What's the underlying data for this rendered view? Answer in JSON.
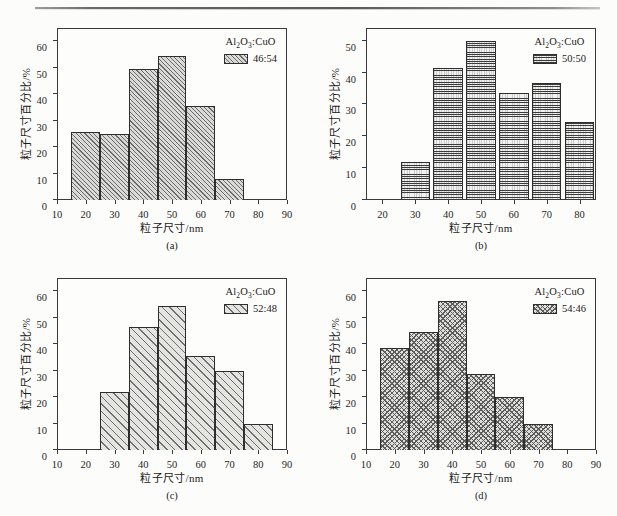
{
  "figure": {
    "axis_title_x": "粒子尺寸/nm",
    "axis_title_y": "粒子尺寸百分比/%",
    "legend_header_html": "Al2O3:CuO",
    "legend_header_parts": {
      "al": "Al",
      "two": "2",
      "o": "O",
      "three": "3",
      "colon_cuo": ":CuO"
    }
  },
  "panels": [
    {
      "id": "a",
      "caption": "(a)",
      "legend_ratio": "46:54",
      "pattern": "diagonal-hatch-dense",
      "xlim": [
        10,
        90
      ],
      "ylim": [
        0,
        65
      ],
      "xticks": [
        10,
        20,
        30,
        40,
        50,
        60,
        70,
        80,
        90
      ],
      "yticks": [
        0,
        10,
        20,
        30,
        40,
        50,
        60
      ],
      "bar_width_nm": 10,
      "bars": [
        {
          "center": 20,
          "value": 25.8
        },
        {
          "center": 30,
          "value": 24.8
        },
        {
          "center": 40,
          "value": 49.4
        },
        {
          "center": 50,
          "value": 54.3
        },
        {
          "center": 60,
          "value": 35.4
        },
        {
          "center": 70,
          "value": 7.8
        }
      ]
    },
    {
      "id": "b",
      "caption": "(b)",
      "legend_ratio": "50:50",
      "pattern": "grid-crosshatch",
      "xlim": [
        15,
        85
      ],
      "ylim": [
        0,
        54
      ],
      "xticks": [
        20,
        30,
        40,
        50,
        60,
        70,
        80
      ],
      "yticks": [
        0,
        10,
        20,
        30,
        40,
        50
      ],
      "bar_width_nm": 9,
      "bars": [
        {
          "center": 30,
          "value": 11.9
        },
        {
          "center": 40,
          "value": 41.6
        },
        {
          "center": 50,
          "value": 49.9
        },
        {
          "center": 60,
          "value": 33.7
        },
        {
          "center": 70,
          "value": 36.8
        },
        {
          "center": 80,
          "value": 24.5
        }
      ]
    },
    {
      "id": "c",
      "caption": "(c)",
      "legend_ratio": "52:48",
      "pattern": "diagonal-hatch-wide",
      "xlim": [
        10,
        90
      ],
      "ylim": [
        0,
        65
      ],
      "xticks": [
        10,
        20,
        30,
        40,
        50,
        60,
        70,
        80,
        90
      ],
      "yticks": [
        0,
        10,
        20,
        30,
        40,
        50,
        60
      ],
      "bar_width_nm": 10,
      "bars": [
        {
          "center": 30,
          "value": 21.8
        },
        {
          "center": 40,
          "value": 46.5
        },
        {
          "center": 50,
          "value": 54.3
        },
        {
          "center": 60,
          "value": 35.4
        },
        {
          "center": 70,
          "value": 29.7
        },
        {
          "center": 80,
          "value": 10.0
        }
      ]
    },
    {
      "id": "d",
      "caption": "(d)",
      "legend_ratio": "54:46",
      "pattern": "diamond-crosshatch",
      "xlim": [
        10,
        90
      ],
      "ylim": [
        0,
        65
      ],
      "xticks": [
        10,
        20,
        30,
        40,
        50,
        60,
        70,
        80,
        90
      ],
      "yticks": [
        0,
        10,
        20,
        30,
        40,
        50,
        60
      ],
      "bar_width_nm": 10,
      "bars": [
        {
          "center": 20,
          "value": 38.7
        },
        {
          "center": 30,
          "value": 44.6
        },
        {
          "center": 40,
          "value": 56.4
        },
        {
          "center": 50,
          "value": 28.8
        },
        {
          "center": 60,
          "value": 20.0
        },
        {
          "center": 70,
          "value": 10.0
        }
      ]
    }
  ],
  "chart_data": {
    "type": "bar",
    "title": "",
    "xlabel": "粒子尺寸/nm",
    "ylabel": "粒子尺寸百分比/%",
    "grid": false,
    "legend_position": "top-right",
    "panels": [
      {
        "label": "(a)",
        "legend": "Al2O3:CuO 46:54",
        "xlim": [
          10,
          90
        ],
        "ylim": [
          0,
          65
        ],
        "categories": [
          20,
          30,
          40,
          50,
          60,
          70
        ],
        "values": [
          25.8,
          24.8,
          49.4,
          54.3,
          35.4,
          7.8
        ]
      },
      {
        "label": "(b)",
        "legend": "Al2O3:CuO 50:50",
        "xlim": [
          15,
          85
        ],
        "ylim": [
          0,
          54
        ],
        "categories": [
          30,
          40,
          50,
          60,
          70,
          80
        ],
        "values": [
          11.9,
          41.6,
          49.9,
          33.7,
          36.8,
          24.5
        ]
      },
      {
        "label": "(c)",
        "legend": "Al2O3:CuO 52:48",
        "xlim": [
          10,
          90
        ],
        "ylim": [
          0,
          65
        ],
        "categories": [
          30,
          40,
          50,
          60,
          70,
          80
        ],
        "values": [
          21.8,
          46.5,
          54.3,
          35.4,
          29.7,
          10.0
        ]
      },
      {
        "label": "(d)",
        "legend": "Al2O3:CuO 54:46",
        "xlim": [
          10,
          90
        ],
        "ylim": [
          0,
          65
        ],
        "categories": [
          20,
          30,
          40,
          50,
          60,
          70
        ],
        "values": [
          38.7,
          44.6,
          56.4,
          28.8,
          20.0,
          10.0
        ]
      }
    ]
  }
}
